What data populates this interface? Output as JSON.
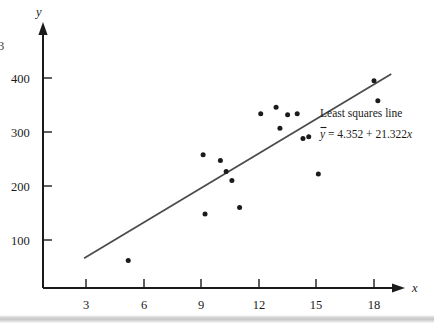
{
  "figure": {
    "background_color": "#ffffff",
    "axis_color": "#1b1b1b",
    "point_color": "#1b1b1b",
    "line_color": "#4a4a4a",
    "edge_glyph": "3"
  },
  "annotation": {
    "title": "Least squares line",
    "equation_yhat": "y",
    "equation_rest": " = 4.352 + 21.322",
    "equation_var": "x",
    "intercept": 4.352,
    "slope": 21.322
  },
  "footer": {
    "band_color": "#c9c9c9"
  },
  "chart_data": {
    "type": "scatter",
    "title": "",
    "xlabel": "x",
    "ylabel": "y",
    "grid": false,
    "legend_position": "none",
    "xlim": [
      0,
      20.5
    ],
    "ylim": [
      0,
      470
    ],
    "xticks": [
      3,
      6,
      9,
      12,
      15,
      18
    ],
    "yticks": [
      100,
      200,
      300,
      400
    ],
    "xtick_labels": [
      "3",
      "6",
      "9",
      "12",
      "15",
      "18"
    ],
    "ytick_labels": [
      "100",
      "200",
      "300",
      "400"
    ],
    "series": [
      {
        "name": "observations",
        "marker": "filled-circle",
        "points": [
          [
            5.2,
            62
          ],
          [
            9.1,
            258
          ],
          [
            9.2,
            148
          ],
          [
            10.0,
            247
          ],
          [
            10.3,
            227
          ],
          [
            10.6,
            210
          ],
          [
            11.0,
            160
          ],
          [
            12.1,
            334
          ],
          [
            12.9,
            346
          ],
          [
            13.1,
            307
          ],
          [
            13.5,
            332
          ],
          [
            14.0,
            334
          ],
          [
            14.3,
            288
          ],
          [
            14.6,
            291
          ],
          [
            15.1,
            222
          ],
          [
            18.0,
            395
          ],
          [
            18.2,
            358
          ]
        ]
      }
    ],
    "fit_line": {
      "name": "Least squares line",
      "equation": "y-hat = 4.352 + 21.322x",
      "intercept": 4.352,
      "slope": 21.322,
      "x_start": 2.9,
      "x_end": 18.9
    },
    "annotations": [
      {
        "text": "Least squares line",
        "x": 15.0,
        "y": 318
      },
      {
        "text": "y-hat = 4.352 + 21.322x",
        "x": 15.0,
        "y": 292
      }
    ]
  }
}
